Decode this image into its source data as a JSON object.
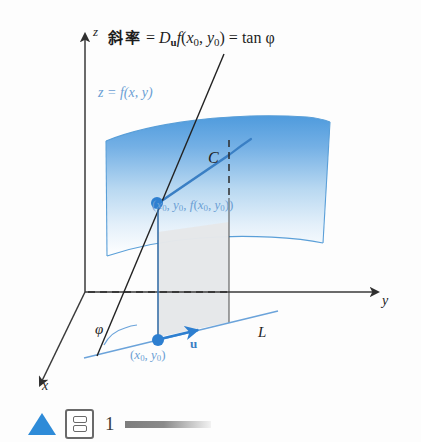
{
  "figure": {
    "title_equation": {
      "cjk_prefix": "斜率",
      "equals_1": "=",
      "operator": "D",
      "operator_sub": "u",
      "function": "f",
      "args": "(x0, y0)",
      "equals_2": "=",
      "result": "tan φ",
      "full_text": "斜率 = Du f(x0, y0) = tan φ"
    },
    "surface_equation": "z = f(x, y)",
    "point_3d_label": "(x0, y0, f(x0, y0))",
    "point_2d_label": "(x0, y0)",
    "vector_label": "u",
    "curve_label": "C",
    "line_label": "L",
    "angle_label": "φ",
    "axes": {
      "z": "z",
      "y": "y",
      "x": "x"
    },
    "colors": {
      "surface_top": "#5ba3e0",
      "surface_bottom": "#ffffff",
      "curve_blue": "#3a7fc4",
      "point_blue": "#2e7fd0",
      "label_blue": "#6b9fd4",
      "plane_gray": "#e4e6e8",
      "axis_black": "#3a3a3a",
      "accent_triangle": "#2e8bd8"
    }
  },
  "footer": {
    "number": "1",
    "triangle_icon": "triangle-up-icon",
    "box_icon": "stacked-panels-icon",
    "gradient_bar": "gradient-scale-bar"
  }
}
